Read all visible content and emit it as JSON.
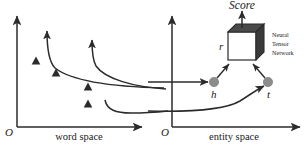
{
  "figure": {
    "background_color": "#ffffff",
    "stroke_color": "#2b2b2b",
    "node_fill_color": "#8c8c8c",
    "cube_front_color": "#ffffff",
    "cube_top_color": "#4a4a4a",
    "cube_side_color": "#3a3a3a",
    "marker_color": "#2b2b2b"
  },
  "left_plot": {
    "name": "word-space-plot",
    "origin_label": "O",
    "x_axis_label": "word space",
    "marker_shape": "triangle",
    "marker_count": 4,
    "markers": [
      {
        "x": 36,
        "y": 61
      },
      {
        "x": 56,
        "y": 73
      },
      {
        "x": 88,
        "y": 87
      },
      {
        "x": 88,
        "y": 104
      }
    ],
    "projection_curves": 2
  },
  "right_plot": {
    "name": "entity-space-plot",
    "origin_label": "O",
    "x_axis_label": "entity space",
    "nodes": [
      {
        "id": "h",
        "label": "h",
        "x": 214,
        "y": 82
      },
      {
        "id": "t",
        "label": "t",
        "x": 268,
        "y": 82
      }
    ],
    "relation_label": "r",
    "score_label": "Score",
    "module_label_lines": [
      "Neural",
      "Tensor",
      "Network"
    ],
    "module_label": "Neural Tensor Network"
  }
}
